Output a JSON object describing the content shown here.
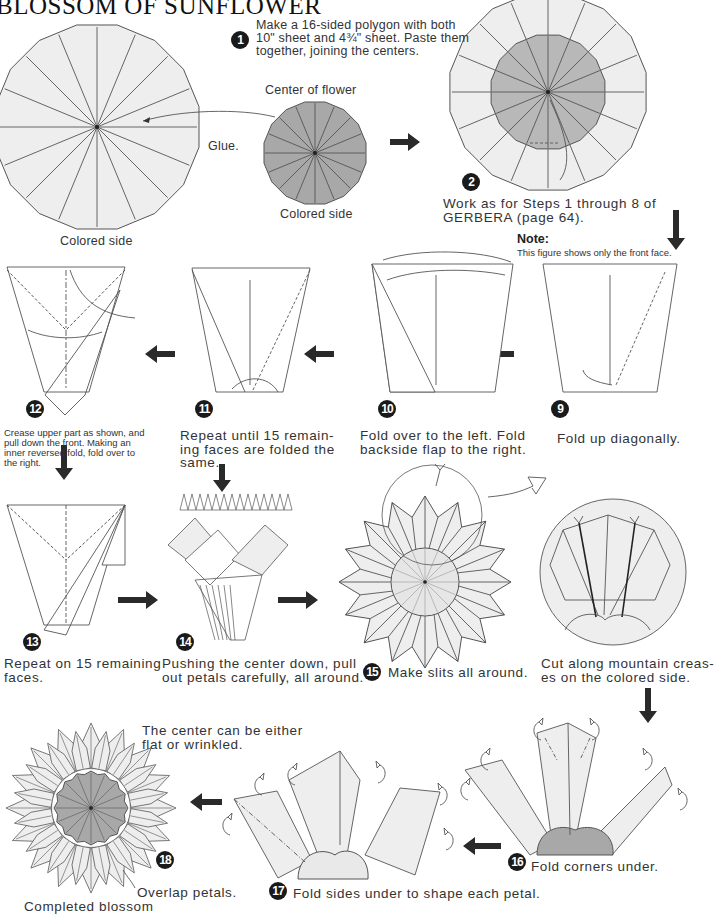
{
  "page": {
    "title": "BLOSSOM OF SUNFLOWER"
  },
  "colors": {
    "paper_light": "#eeeeee",
    "paper_colored": "#a8a8a8",
    "line": "#555555",
    "arrow": "#2a2a2a",
    "badge": "#1a1a1a"
  },
  "steps": [
    {
      "number": "1",
      "lines": [
        "Make a 16-sided polygon with both",
        "10\" sheet and 4¾\" sheet. Paste them",
        "together, joining the centers."
      ]
    },
    {
      "number": "2",
      "lines": [
        "Work as for Steps 1 through 8 of",
        "GERBERA (page 64)."
      ]
    },
    {
      "number": "9",
      "lines": [
        "Fold up diagonally."
      ]
    },
    {
      "number": "10",
      "lines": [
        "Fold over to the left. Fold",
        "backside flap to the right."
      ]
    },
    {
      "number": "11",
      "lines": [
        "Repeat until 15 remain-",
        "ing faces are folded the",
        "same."
      ]
    },
    {
      "number": "12",
      "lines": [
        "Crease upper part as shown, and",
        "pull down the front. Making an",
        "inner reversed fold, fold over to",
        "the right."
      ]
    },
    {
      "number": "13",
      "lines": [
        "Repeat on 15 remaining",
        "faces."
      ]
    },
    {
      "number": "14",
      "lines": [
        "Pushing the center down, pull",
        "out petals carefully, all around."
      ]
    },
    {
      "number": "15",
      "lines": [
        "Make slits all around."
      ]
    },
    {
      "number": "15b",
      "lines": [
        "Cut along mountain creas-",
        "es on the colored side."
      ]
    },
    {
      "number": "16",
      "lines": [
        "Fold corners under."
      ]
    },
    {
      "number": "17",
      "lines": [
        "Fold sides under to shape each petal."
      ]
    },
    {
      "number": "18",
      "lines": [
        "Overlap petals."
      ]
    }
  ],
  "labels": {
    "colored_side_large": "Colored side",
    "center_of_flower": "Center of flower",
    "colored_side_small": "Colored side",
    "glue": "Glue.",
    "note_title": "Note:",
    "note_text": "This figure shows only the front face.",
    "center_note_1": "The center can be either",
    "center_note_2": "flat or wrinkled.",
    "completed": "Completed blossom"
  }
}
